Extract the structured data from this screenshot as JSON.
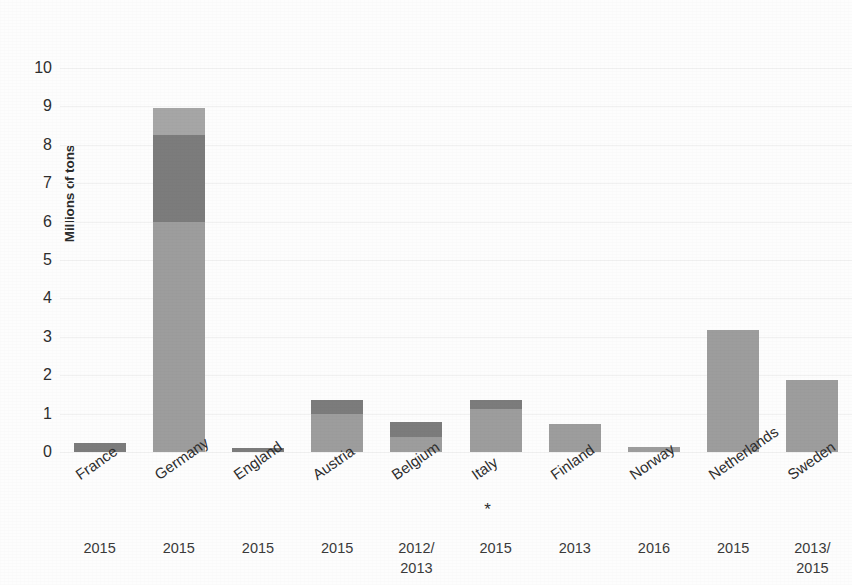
{
  "chart_data": {
    "type": "bar",
    "title": "",
    "subtitle": "",
    "xlabel": "",
    "ylabel": "Millions of tons",
    "ylim": [
      0,
      10
    ],
    "ytick_labels": [
      "10",
      "9",
      "8",
      "7",
      "6",
      "5",
      "4",
      "3",
      "2",
      "1",
      "0"
    ],
    "yticks": [
      10,
      9,
      8,
      7,
      6,
      5,
      4,
      3,
      2,
      1,
      0
    ],
    "grid": true,
    "legend": "none",
    "stacked": true,
    "categories": [
      "France",
      "Germany",
      "England",
      "Austria",
      "Belgium",
      "Italy",
      "Finland",
      "Norway",
      "Netherlands",
      "Sweden"
    ],
    "category_notes": {
      "Italy": "*"
    },
    "secondary_axis_label": "year",
    "years": [
      "2015",
      "2015",
      "2015",
      "2015",
      "2012/\n2013",
      "2015",
      "2013",
      "2016",
      "2015",
      "2013/\n2015"
    ],
    "series": [
      {
        "name": "lower-segment",
        "color": "#9d9d9d",
        "values": [
          0.0,
          6.0,
          0.0,
          1.0,
          0.39,
          1.12,
          0.72,
          0.12,
          3.17,
          1.88
        ]
      },
      {
        "name": "middle-segment",
        "color": "#7c7c7c",
        "values": [
          0.24,
          2.25,
          0.1,
          0.35,
          0.39,
          0.23,
          0.0,
          0.0,
          0.0,
          0.0
        ]
      },
      {
        "name": "upper-segment",
        "color": "#a6a6a6",
        "values": [
          0.0,
          0.72,
          0.0,
          0.0,
          0.0,
          0.0,
          0.0,
          0.0,
          0.0,
          0.0
        ]
      }
    ],
    "totals": [
      0.24,
      8.97,
      0.1,
      1.35,
      0.78,
      1.35,
      0.72,
      0.12,
      3.17,
      1.88
    ]
  },
  "colors": {
    "background": "#fdfdfd",
    "gridline": "#f1f1f1",
    "text": "#2e2e2e",
    "bar_light": "#a6a6a6",
    "bar_mid": "#9d9d9d",
    "bar_dark": "#7c7c7c"
  }
}
